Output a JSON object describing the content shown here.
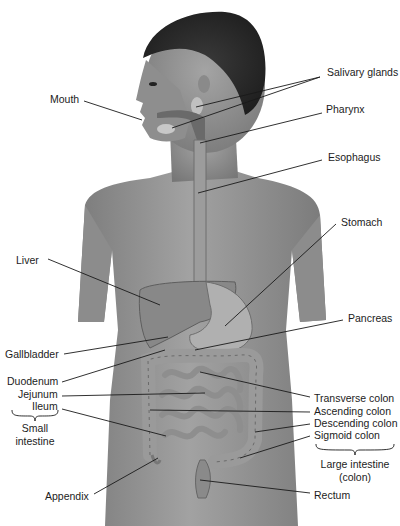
{
  "figure": {
    "labels": {
      "salivary_glands": "Salivary glands",
      "mouth": "Mouth",
      "pharynx": "Pharynx",
      "esophagus": "Esophagus",
      "stomach": "Stomach",
      "liver": "Liver",
      "pancreas": "Pancreas",
      "gallbladder": "Gallbladder",
      "duodenum": "Duodenum",
      "jejunum": "Jejunum",
      "ileum": "Ileum",
      "small_intestine_line1": "Small",
      "small_intestine_line2": "intestine",
      "appendix": "Appendix",
      "transverse_colon": "Transverse colon",
      "ascending_colon": "Ascending colon",
      "descending_colon": "Descending colon",
      "sigmoid_colon": "Sigmoid colon",
      "large_intestine_line1": "Large intestine",
      "large_intestine_line2": "(colon)",
      "rectum": "Rectum"
    },
    "colors": {
      "background": "#ffffff",
      "skin": "#8a8a8a",
      "skin_shadow": "#6e6e6e",
      "hair": "#2b2b2b",
      "organ": "#a0a0a0",
      "organ_dark": "#7a7a7a",
      "leader_line": "#1a1a1a"
    }
  }
}
